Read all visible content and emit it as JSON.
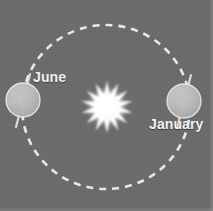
{
  "figure": {
    "background_color": "#6b6b6b",
    "width": 213,
    "height": 211
  },
  "orbit": {
    "name": "orbit-path",
    "style": "dashed-ellipse",
    "stroke_color": "#efefef",
    "center": {
      "x": 106,
      "y": 107
    },
    "radius_x": 84,
    "radius_y": 82,
    "dash": "7 6"
  },
  "sun": {
    "name": "sun",
    "color": "#ffffff",
    "glow_color": "#f3f3f3",
    "center": {
      "x": 107,
      "y": 107
    },
    "core_radius": 10,
    "ray_count": 14,
    "ray_length": 20
  },
  "planets": [
    {
      "id": "june",
      "label": "June",
      "label_color": "#f2f2f2",
      "center": {
        "x": 23,
        "y": 100
      },
      "radius": 17,
      "body_color": "#c9c9c9",
      "axis_tilt_deg": -18,
      "axis_color": "#e8e8e8"
    },
    {
      "id": "january",
      "label": "January",
      "label_color": "#f2f2f2",
      "center": {
        "x": 184,
        "y": 101
      },
      "radius": 17,
      "body_color": "#cdcdcd",
      "axis_tilt_deg": -18,
      "axis_color": "#e8e8e8"
    }
  ]
}
